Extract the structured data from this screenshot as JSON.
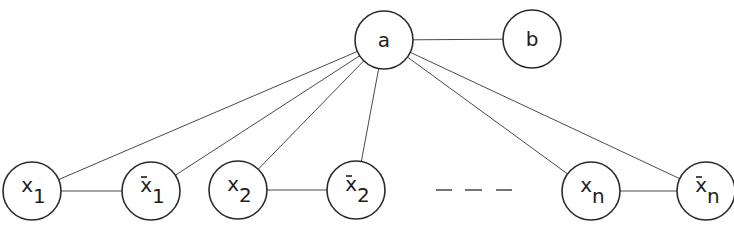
{
  "diagram": {
    "type": "graph",
    "nodes": [
      {
        "id": "a",
        "label": "a",
        "sub": "",
        "bar": false
      },
      {
        "id": "b",
        "label": "b",
        "sub": "",
        "bar": false
      },
      {
        "id": "x1",
        "label": "x",
        "sub": "1",
        "bar": false
      },
      {
        "id": "x1bar",
        "label": "x",
        "sub": "1",
        "bar": true
      },
      {
        "id": "x2",
        "label": "x",
        "sub": "2",
        "bar": false
      },
      {
        "id": "x2bar",
        "label": "x",
        "sub": "2",
        "bar": true
      },
      {
        "id": "xn",
        "label": "x",
        "sub": "n",
        "bar": false
      },
      {
        "id": "xnbar",
        "label": "x",
        "sub": "n",
        "bar": true
      }
    ],
    "edges": [
      [
        "a",
        "b"
      ],
      [
        "a",
        "x1"
      ],
      [
        "a",
        "x1bar"
      ],
      [
        "a",
        "x2"
      ],
      [
        "a",
        "x2bar"
      ],
      [
        "a",
        "xn"
      ],
      [
        "a",
        "xnbar"
      ],
      [
        "x1",
        "x1bar"
      ],
      [
        "x2",
        "x2bar"
      ],
      [
        "xn",
        "xnbar"
      ]
    ],
    "ellipsis": "— — —"
  }
}
